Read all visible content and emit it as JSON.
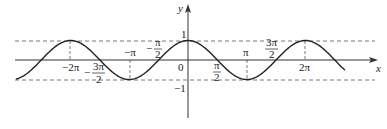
{
  "chart_data": {
    "type": "line",
    "title": "",
    "function": "y = cos x",
    "xlabel": "x",
    "ylabel": "y",
    "xlim": [
      -7.28,
      6.2
    ],
    "ylim": [
      -1.5,
      1.5
    ],
    "grid": false,
    "legend": null,
    "x_tick_labels": [
      {
        "text": "−2π",
        "value": -6.2832
      },
      {
        "text": "−3π/2",
        "value": -4.7124
      },
      {
        "text": "−π",
        "value": -3.1416
      },
      {
        "text": "−π/2",
        "value": -1.5708
      },
      {
        "text": "0",
        "value": 0
      },
      {
        "text": "π/2",
        "value": 1.5708
      },
      {
        "text": "π",
        "value": 3.1416
      },
      {
        "text": "3π/2",
        "value": 4.7124
      },
      {
        "text": "2π",
        "value": 6.2832
      }
    ],
    "y_tick_labels": [
      {
        "text": "1",
        "value": 1
      },
      {
        "text": "−1",
        "value": -1
      }
    ],
    "reference_lines": [
      {
        "orientation": "horizontal",
        "value": 1,
        "style": "dashed"
      },
      {
        "orientation": "horizontal",
        "value": -1,
        "style": "dashed"
      },
      {
        "orientation": "vertical",
        "value": -6.2832,
        "from": 0,
        "to": 1,
        "style": "dashed"
      },
      {
        "orientation": "vertical",
        "value": -3.1416,
        "from": 0,
        "to": -1,
        "style": "dashed"
      },
      {
        "orientation": "vertical",
        "value": 3.1416,
        "from": 0,
        "to": -1,
        "style": "dashed"
      },
      {
        "orientation": "vertical",
        "value": 6.2832,
        "from": 0,
        "to": 1,
        "style": "dashed"
      }
    ],
    "series": [
      {
        "name": "cos x",
        "x": [
          -9.42,
          -7.85,
          -6.28,
          -4.71,
          -3.14,
          -1.57,
          0,
          1.57,
          3.14,
          4.71,
          6.28,
          7.85,
          8.9
        ],
        "y": [
          -1,
          0,
          1,
          0,
          -1,
          0,
          1,
          0,
          -1,
          0,
          1,
          0,
          -0.5
        ]
      }
    ]
  },
  "labels": {
    "x_axis": "x",
    "y_axis": "y",
    "origin": "0",
    "y_one": "1",
    "y_neg_one": "−1",
    "neg_two_pi": "−2π",
    "neg_three_pi_num": "3π",
    "neg_three_pi_den": "2",
    "neg_three_pi_sign": "−",
    "neg_pi": "−π",
    "neg_half_pi_num": "π",
    "neg_half_pi_den": "2",
    "neg_half_pi_sign": "−",
    "half_pi_num": "π",
    "half_pi_den": "2",
    "pi": "π",
    "three_half_pi_num": "3π",
    "three_half_pi_den": "2",
    "two_pi": "2π"
  },
  "colors": {
    "curve": "#222222",
    "axis": "#333333",
    "dashed": "#555555",
    "text": "#222222"
  }
}
